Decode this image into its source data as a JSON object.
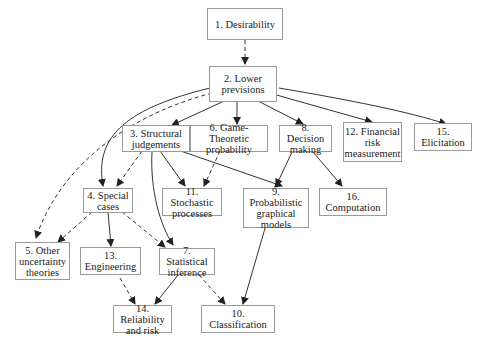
{
  "diagram": {
    "nodes": [
      {
        "id": "n1",
        "label": "1. Desirability"
      },
      {
        "id": "n2",
        "label": "2. Lower previsions"
      },
      {
        "id": "n3",
        "label": "3. Structural judgements"
      },
      {
        "id": "n4",
        "label": "4. Special cases"
      },
      {
        "id": "n5",
        "label": "5. Other uncertainty theories"
      },
      {
        "id": "n6",
        "label": "6. Game-Theoretic probability"
      },
      {
        "id": "n7",
        "label": "7. Statistical inference"
      },
      {
        "id": "n8",
        "label": "8. Decision making"
      },
      {
        "id": "n9",
        "label": "9. Probabilistic graphical models"
      },
      {
        "id": "n10",
        "label": "10. Classification"
      },
      {
        "id": "n11",
        "label": "11. Stochastic processes"
      },
      {
        "id": "n12",
        "label": "12. Financial risk measurement"
      },
      {
        "id": "n13",
        "label": "13. Engineering"
      },
      {
        "id": "n14",
        "label": "14. Reliability and risk"
      },
      {
        "id": "n15",
        "label": "15. Elicitation"
      },
      {
        "id": "n16",
        "label": "16. Computation"
      }
    ],
    "edges": [
      {
        "from": "n1",
        "to": "n2",
        "style": "dashed"
      },
      {
        "from": "n2",
        "to": "n3",
        "style": "solid"
      },
      {
        "from": "n2",
        "to": "n6",
        "style": "solid"
      },
      {
        "from": "n2",
        "to": "n8",
        "style": "solid"
      },
      {
        "from": "n2",
        "to": "n12",
        "style": "solid"
      },
      {
        "from": "n2",
        "to": "n15",
        "style": "solid"
      },
      {
        "from": "n2",
        "to": "n4",
        "style": "solid"
      },
      {
        "from": "n2",
        "to": "n5",
        "style": "dashed"
      },
      {
        "from": "n3",
        "to": "n4",
        "style": "dashed"
      },
      {
        "from": "n3",
        "to": "n11",
        "style": "solid"
      },
      {
        "from": "n3",
        "to": "n9",
        "style": "solid"
      },
      {
        "from": "n3",
        "to": "n7",
        "style": "solid"
      },
      {
        "from": "n6",
        "to": "n11",
        "style": "dashed"
      },
      {
        "from": "n8",
        "to": "n9",
        "style": "solid"
      },
      {
        "from": "n8",
        "to": "n16",
        "style": "solid"
      },
      {
        "from": "n4",
        "to": "n5",
        "style": "dashed"
      },
      {
        "from": "n4",
        "to": "n13",
        "style": "solid"
      },
      {
        "from": "n4",
        "to": "n7",
        "style": "dashed"
      },
      {
        "from": "n13",
        "to": "n14",
        "style": "dashed"
      },
      {
        "from": "n7",
        "to": "n14",
        "style": "solid"
      },
      {
        "from": "n7",
        "to": "n10",
        "style": "dashed"
      },
      {
        "from": "n9",
        "to": "n10",
        "style": "solid"
      }
    ],
    "legend": {
      "solid_arrow": "solid",
      "dashed_arrow": "dashed"
    }
  }
}
